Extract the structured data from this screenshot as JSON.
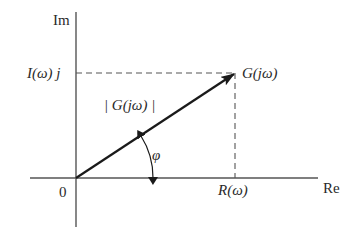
{
  "diagram": {
    "axes": {
      "imag_label": "Im",
      "real_label": "Re",
      "origin_label": "0"
    },
    "point": {
      "label": "G(jω)"
    },
    "projections": {
      "imag_part_label": "I(ω) j",
      "real_part_label": "R(ω)"
    },
    "vector": {
      "magnitude_label": "| G(jω) |"
    },
    "angle": {
      "label": "φ"
    },
    "colors": {
      "line": "#1a1a1a",
      "axis": "#555555",
      "dash": "#555555",
      "text": "#2a2a2a"
    }
  }
}
